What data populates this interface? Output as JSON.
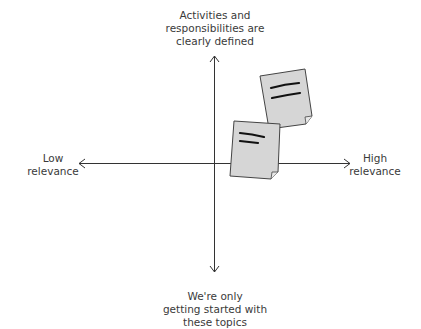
{
  "diagram": {
    "type": "2x2 quadrant / axis diagram",
    "axes": {
      "vertical": {
        "top_label": "Activities and responsibilities are clearly defined",
        "top_lines": [
          "Activities and",
          "responsibilities are",
          "clearly defined"
        ],
        "bottom_label": "We're only getting started with these topics",
        "bottom_lines": [
          "We're only",
          "getting started with",
          "these topics"
        ]
      },
      "horizontal": {
        "left_label": "Low relevance",
        "left_lines": [
          "Low",
          "relevance"
        ],
        "right_label": "High relevance",
        "right_lines": [
          "High",
          "relevance"
        ]
      }
    },
    "sticky_notes": [
      {
        "id": "note-1",
        "position": "upper right, near top",
        "color": "#d6d6d6",
        "lines": 2
      },
      {
        "id": "note-2",
        "position": "upper right, near center",
        "color": "#d6d6d6",
        "lines": 2
      }
    ],
    "colors": {
      "axis": "#333333",
      "note_fill": "#d6d6d6",
      "note_stroke": "#444444",
      "text": "#3a3a3a"
    }
  }
}
